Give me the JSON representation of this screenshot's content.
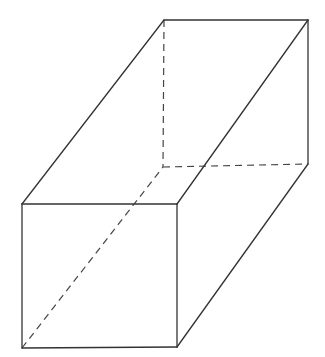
{
  "diagram": {
    "type": "rectangular-prism",
    "stroke_color": "#333333",
    "vertices": {
      "front_top_left": [
        22,
        204
      ],
      "front_top_right": [
        177,
        204
      ],
      "front_bottom_right": [
        177,
        347
      ],
      "front_bottom_left": [
        22,
        348
      ],
      "back_top_left": [
        164,
        20
      ],
      "back_top_right": [
        308,
        20
      ],
      "back_bottom_right": [
        308,
        164
      ],
      "back_bottom_left": [
        163,
        167
      ]
    },
    "visible_edges": [
      [
        "front_top_left",
        "front_top_right"
      ],
      [
        "front_top_right",
        "front_bottom_right"
      ],
      [
        "front_bottom_right",
        "front_bottom_left"
      ],
      [
        "front_bottom_left",
        "front_top_left"
      ],
      [
        "back_top_left",
        "back_top_right"
      ],
      [
        "back_top_right",
        "back_bottom_right"
      ],
      [
        "front_top_left",
        "back_top_left"
      ],
      [
        "front_top_right",
        "back_top_right"
      ],
      [
        "front_bottom_right",
        "back_bottom_right"
      ]
    ],
    "hidden_edges": [
      [
        "back_top_left",
        "back_bottom_left"
      ],
      [
        "back_bottom_left",
        "back_bottom_right"
      ],
      [
        "front_bottom_left",
        "back_bottom_left"
      ]
    ]
  }
}
